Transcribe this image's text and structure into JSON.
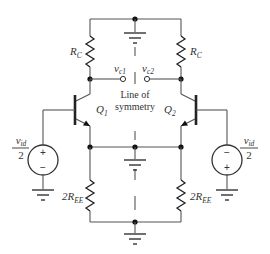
{
  "diagram": {
    "type": "circuit-schematic",
    "labels": {
      "rc_left": "R",
      "rc_left_sub": "C",
      "rc_right": "R",
      "rc_right_sub": "C",
      "ree_left_prefix": "2R",
      "ree_left_sub": "EE",
      "ree_right_prefix": "2R",
      "ree_right_sub": "EE",
      "q1": "Q",
      "q1_sub": "1",
      "q2": "Q",
      "q2_sub": "2",
      "vc1": "v",
      "vc1_sub": "c1",
      "vc2": "v",
      "vc2_sub": "c2",
      "symmetry_line_1": "Line of",
      "symmetry_line_2": "symmetry",
      "src_left_num": "v",
      "src_left_num_sub": "id",
      "src_left_den": "2",
      "src_right_num": "v",
      "src_right_num_sub": "id",
      "src_right_den": "2",
      "src_left_top": "+",
      "src_left_bottom": "−",
      "src_right_top": "−",
      "src_right_bottom": "+"
    },
    "components": [
      {
        "id": "RC1",
        "type": "resistor",
        "label": "R_C"
      },
      {
        "id": "RC2",
        "type": "resistor",
        "label": "R_C"
      },
      {
        "id": "Q1",
        "type": "npn-transistor",
        "label": "Q_1"
      },
      {
        "id": "Q2",
        "type": "npn-transistor",
        "label": "Q_2"
      },
      {
        "id": "REE1",
        "type": "resistor",
        "label": "2R_EE"
      },
      {
        "id": "REE2",
        "type": "resistor",
        "label": "2R_EE"
      },
      {
        "id": "V1",
        "type": "voltage-source",
        "label": "v_id/2",
        "polarity": "+ top"
      },
      {
        "id": "V2",
        "type": "voltage-source",
        "label": "v_id/2",
        "polarity": "- top"
      }
    ]
  }
}
